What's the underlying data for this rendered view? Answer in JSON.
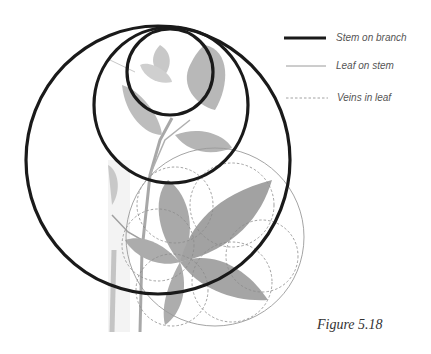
{
  "figure": {
    "caption": "Figure 5.18",
    "legend": [
      {
        "label": "Stem on branch",
        "line_style": "thick-solid",
        "color": "#1a1a1a"
      },
      {
        "label": "Leaf on stem",
        "line_style": "thin-solid",
        "color": "#9a9a9a"
      },
      {
        "label": "Veins in leaf",
        "line_style": "dashed",
        "color": "#8a8a8a"
      }
    ],
    "background_photo": "grayscale photograph of a branch with compound leaves",
    "circles": {
      "stem_on_branch": [
        {
          "cx": 158,
          "cy": 160,
          "rx": 132,
          "ry": 134
        },
        {
          "cx": 171,
          "cy": 105,
          "rx": 77,
          "ry": 78
        },
        {
          "cx": 170,
          "cy": 72,
          "rx": 43,
          "ry": 43
        }
      ],
      "leaf_on_stem": [
        {
          "cx": 215,
          "cy": 237,
          "r": 89
        }
      ],
      "veins_in_leaf": [
        {
          "cx": 175,
          "cy": 205,
          "r": 38
        },
        {
          "cx": 232,
          "cy": 205,
          "r": 42
        },
        {
          "cx": 262,
          "cy": 256,
          "r": 36
        },
        {
          "cx": 232,
          "cy": 282,
          "r": 40
        },
        {
          "cx": 172,
          "cy": 290,
          "r": 36
        },
        {
          "cx": 158,
          "cy": 245,
          "r": 36
        }
      ]
    }
  }
}
